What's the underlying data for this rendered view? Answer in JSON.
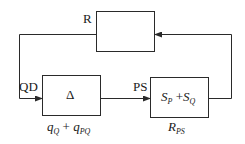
{
  "diagram": {
    "blocks": [
      {
        "id": "R",
        "label": "R",
        "content": ""
      },
      {
        "id": "delta",
        "label": "QD",
        "content": "Δ",
        "caption_main": "q",
        "caption_sub1": "Q",
        "caption_plus": " + ",
        "caption_main2": "q",
        "caption_sub2": "PQ"
      },
      {
        "id": "PS",
        "label": "PS",
        "content_s1": "S",
        "content_sub1": "P",
        "content_plus": " +",
        "content_s2": "S",
        "content_sub2": "Q",
        "caption_main": "R",
        "caption_sub": "PS"
      }
    ],
    "edges": [
      {
        "from": "R",
        "to": "delta",
        "label": "QD"
      },
      {
        "from": "delta",
        "to": "PS",
        "label": "PS"
      },
      {
        "from": "PS",
        "to": "R",
        "label": ""
      }
    ],
    "colors": {
      "line": "#2a2a2a",
      "background": "#ffffff"
    }
  }
}
